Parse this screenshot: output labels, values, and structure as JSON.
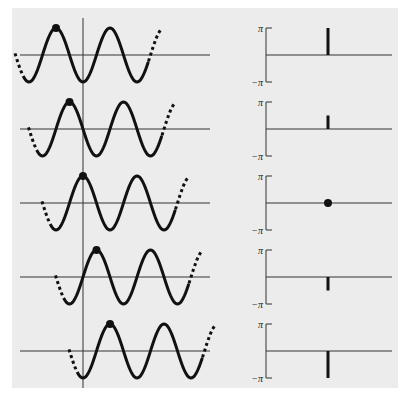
{
  "figure": {
    "background_color": "#ececec",
    "ink_color": "#111111",
    "axis_color": "#333333"
  },
  "phase_axis": {
    "top_label": "π",
    "bottom_label": "−π"
  },
  "rows": [
    {
      "phase_label": "π",
      "phase_value": 3.14159,
      "marker": "stem"
    },
    {
      "phase_label": "π/2",
      "phase_value": 1.5708,
      "marker": "stem"
    },
    {
      "phase_label": "0",
      "phase_value": 0,
      "marker": "dot"
    },
    {
      "phase_label": "−π/2",
      "phase_value": -1.5708,
      "marker": "stem"
    },
    {
      "phase_label": "−π",
      "phase_value": -3.14159,
      "marker": "stem"
    }
  ],
  "chart_data": [
    {
      "type": "line",
      "title": "Shifted sinusoids (left column)",
      "description": "Five copies of a cosine wave, each shifted right by a quarter period relative to the row above; a dot marks the peak nearest the origin.",
      "series": [
        {
          "name": "row 1",
          "phase_shift": "π",
          "peak_offset_periods": -0.5
        },
        {
          "name": "row 2",
          "phase_shift": "π/2",
          "peak_offset_periods": -0.25
        },
        {
          "name": "row 3",
          "phase_shift": "0",
          "peak_offset_periods": 0
        },
        {
          "name": "row 4",
          "phase_shift": "−π/2",
          "peak_offset_periods": 0.25
        },
        {
          "name": "row 5",
          "phase_shift": "−π",
          "peak_offset_periods": 0.5
        }
      ],
      "xlabel": "",
      "ylabel": "",
      "grid": false
    },
    {
      "type": "bar",
      "title": "Phase spectrum (right column)",
      "categories": [
        "row 1",
        "row 2",
        "row 3",
        "row 4",
        "row 5"
      ],
      "values": [
        3.14159,
        1.5708,
        0,
        -1.5708,
        -3.14159
      ],
      "ylim": [
        -3.14159,
        3.14159
      ],
      "ytick_labels": [
        "−π",
        "π"
      ],
      "xlabel": "",
      "ylabel": "",
      "grid": false
    }
  ]
}
